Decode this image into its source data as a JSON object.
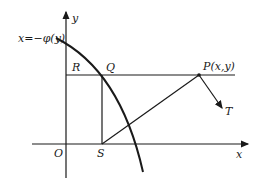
{
  "diagram": {
    "labels": {
      "curve": "x=−φ(y)",
      "y_axis": "y",
      "x_axis": "x",
      "origin": "O",
      "R": "R",
      "Q": "Q",
      "P": "P(x,y)",
      "T": "T",
      "S": "S"
    },
    "colors": {
      "stroke": "#1a1a1a",
      "background": "#ffffff"
    }
  }
}
